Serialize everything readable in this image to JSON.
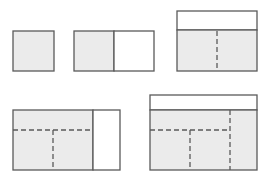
{
  "colors": {
    "background": "#ffffff",
    "fill": "#ebebeb",
    "empty": "#ffffff",
    "stroke": "#5a5a5a"
  },
  "panels": [
    {
      "name": "panel-1",
      "description": "single gray square",
      "x": 13,
      "y": 31,
      "w": 41,
      "h": 40
    },
    {
      "name": "panel-2",
      "description": "gray square with empty square to the right",
      "x": 74,
      "y": 31,
      "w": 80,
      "h": 40,
      "divider_x": 114
    },
    {
      "name": "panel-3",
      "description": "empty strip on top of two gray squares split by dashed line",
      "x": 177,
      "y": 11,
      "w": 80,
      "h": 60,
      "header_y": 30,
      "dashed_x": 217
    },
    {
      "name": "panel-4",
      "description": "gray region with dashed subdivisions and empty strip on right",
      "x": 13,
      "y": 110,
      "w": 107,
      "h": 60,
      "divider_x": 93,
      "dashed_y": 130,
      "dashed_x": 53
    },
    {
      "name": "panel-5",
      "description": "empty top strip, gray region with dashed subdivisions",
      "x": 150,
      "y": 95,
      "w": 107,
      "h": 75,
      "header_y": 110,
      "dashed_x1": 230,
      "dashed_y": 130,
      "dashed_x2": 190
    }
  ]
}
